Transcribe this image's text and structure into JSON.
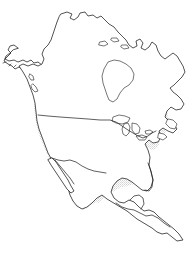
{
  "figure": {
    "type": "outline-map",
    "width": 193,
    "height": 255,
    "background_color": "#ffffff",
    "outline_color": "#1a1a1a",
    "shading_color": "#d8d8d8",
    "shading_style": "stipple-dither",
    "shading_description": "Light gray stippled fill covering the contiguous United States, southern Canada and most of Mexico"
  },
  "regions": {
    "shaded": {
      "name": "highlighted-range",
      "label": "Shaded distribution area",
      "color": "#d8d8d8",
      "covers": [
        "Contiguous United States",
        "Southern Canada",
        "Northern and central Mexico",
        "Baja California"
      ]
    },
    "unshaded": {
      "name": "unshaded-area",
      "label": "Unshaded land area",
      "color": "#ffffff",
      "covers": [
        "Alaska",
        "Northern Canada",
        "Hudson Bay",
        "Labrador",
        "Newfoundland",
        "Florida peninsula",
        "Yucatan peninsula",
        "Central America"
      ]
    }
  },
  "features": [
    {
      "id": "alaska",
      "label": "Alaska"
    },
    {
      "id": "canada",
      "label": "Canada"
    },
    {
      "id": "hudson-bay",
      "label": "Hudson Bay"
    },
    {
      "id": "labrador",
      "label": "Labrador"
    },
    {
      "id": "newfoundland",
      "label": "Newfoundland"
    },
    {
      "id": "nova-scotia",
      "label": "Nova Scotia"
    },
    {
      "id": "great-lakes",
      "label": "Great Lakes"
    },
    {
      "id": "united-states",
      "label": "United States"
    },
    {
      "id": "us-canada-border",
      "label": "United States - Canada border"
    },
    {
      "id": "us-mexico-border",
      "label": "United States - Mexico border"
    },
    {
      "id": "florida",
      "label": "Florida"
    },
    {
      "id": "gulf-of-mexico",
      "label": "Gulf of Mexico"
    },
    {
      "id": "baja-california",
      "label": "Baja California"
    },
    {
      "id": "mexico",
      "label": "Mexico"
    },
    {
      "id": "yucatan",
      "label": "Yucatan Peninsula"
    },
    {
      "id": "central-america",
      "label": "Central America"
    },
    {
      "id": "vancouver-island",
      "label": "Vancouver Island"
    }
  ]
}
